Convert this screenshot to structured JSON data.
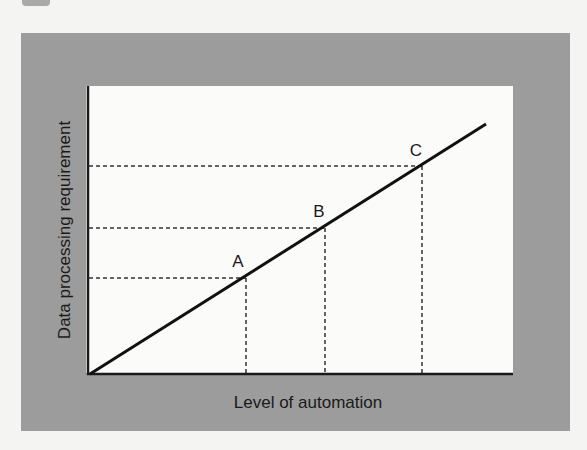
{
  "figure": {
    "x_axis_label": "Level of automation",
    "y_axis_label": "Data processing requirement",
    "points": [
      {
        "label": "A"
      },
      {
        "label": "B"
      },
      {
        "label": "C"
      }
    ]
  },
  "colors": {
    "frame": "#9c9c9c",
    "plot_background": "#fbfbf9",
    "ink": "#1a1a1a"
  }
}
